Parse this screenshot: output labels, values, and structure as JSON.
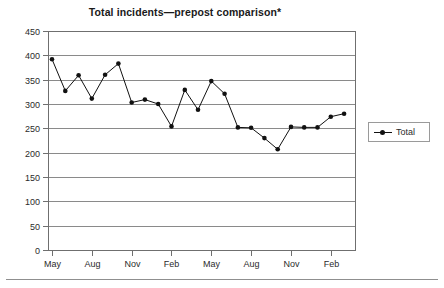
{
  "chart_data": {
    "type": "line",
    "title": "Total incidents—prepost comparison*",
    "xlabel": "",
    "ylabel": "",
    "ylim": [
      0,
      450
    ],
    "ytick_step": 50,
    "yticks": [
      0,
      50,
      100,
      150,
      200,
      250,
      300,
      350,
      400,
      450
    ],
    "grid": true,
    "legend_position": "right",
    "xtick_labels": [
      "May",
      "Aug",
      "Nov",
      "Feb",
      "May",
      "Aug",
      "Nov",
      "Feb"
    ],
    "xtick_interval_points": 3,
    "series": [
      {
        "name": "Total",
        "marker": "filled-circle",
        "color": "#111111",
        "values": [
          392,
          327,
          359,
          311,
          360,
          383,
          303,
          309,
          300,
          254,
          329,
          288,
          347,
          321,
          252,
          251,
          230,
          207,
          253,
          252,
          252,
          274,
          280
        ]
      }
    ]
  },
  "legend": {
    "entries": [
      {
        "label": "Total"
      }
    ]
  },
  "axes": {
    "y_labels": [
      "450",
      "400",
      "350",
      "300",
      "250",
      "200",
      "150",
      "100",
      "50",
      "0"
    ],
    "x_labels": [
      "May",
      "Aug",
      "Nov",
      "Feb",
      "May",
      "Aug",
      "Nov",
      "Feb"
    ]
  }
}
